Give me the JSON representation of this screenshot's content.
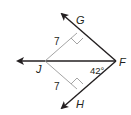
{
  "diagram": {
    "points": {
      "G": "G",
      "J": "J",
      "F": "F",
      "H": "H"
    },
    "lengths": {
      "JG": "7",
      "JH": "7"
    },
    "angle": {
      "JFH": "42°"
    },
    "colors": {
      "ray": "#231f20",
      "segment": "#9a9a9a"
    }
  }
}
